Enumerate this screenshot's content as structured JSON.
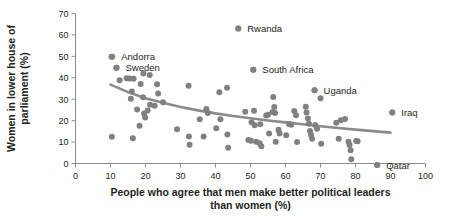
{
  "chart_data": {
    "type": "scatter",
    "title": "",
    "xlabel": "People who agree that men make better political leaders than women (%)",
    "ylabel": "Women in lower house of parliament (%)",
    "xlim": [
      0,
      100
    ],
    "ylim": [
      0,
      70
    ],
    "grid": false,
    "legend": "none",
    "xticks": [
      0,
      10,
      20,
      30,
      40,
      50,
      60,
      70,
      80,
      90,
      100
    ],
    "yticks": [
      0,
      10,
      20,
      30,
      40,
      50,
      60,
      70
    ],
    "point_color": "#808080",
    "trend_color": "#8a8a8a",
    "axis_color": "#8c8c8c",
    "text_color": "#231f20",
    "annotations": [
      {
        "label": "Rwanda",
        "x": 46.5,
        "y": 63.0,
        "dx": 9,
        "dy": 3.5
      },
      {
        "label": "Andorra",
        "x": 10.5,
        "y": 49.8,
        "dx": 9,
        "dy": 3.5
      },
      {
        "label": "Sweden",
        "x": 11.7,
        "y": 44.7,
        "dx": 9,
        "dy": 3.5
      },
      {
        "label": "South Africa",
        "x": 50.8,
        "y": 43.8,
        "dx": 9,
        "dy": 3.5
      },
      {
        "label": "Uganda",
        "x": 68.3,
        "y": 34.2,
        "dx": 9,
        "dy": 3.5
      },
      {
        "label": "Iraq",
        "x": 90.5,
        "y": 23.8,
        "dx": 9,
        "dy": 3.5
      },
      {
        "label": "Qatar",
        "x": 86.2,
        "y": -0.7,
        "dx": 9,
        "dy": 3.5
      }
    ],
    "points": [
      {
        "x": 10.3,
        "y": 49.8
      },
      {
        "x": 11.7,
        "y": 44.7
      },
      {
        "x": 10.4,
        "y": 12.5
      },
      {
        "x": 12.6,
        "y": 38.9
      },
      {
        "x": 14.6,
        "y": 39.8
      },
      {
        "x": 15.5,
        "y": 39.7
      },
      {
        "x": 16.1,
        "y": 33.6
      },
      {
        "x": 15.8,
        "y": 30.2
      },
      {
        "x": 16.6,
        "y": 39.5
      },
      {
        "x": 16.4,
        "y": 11.8
      },
      {
        "x": 17.6,
        "y": 25.2
      },
      {
        "x": 18.3,
        "y": 17.6
      },
      {
        "x": 18.6,
        "y": 37.1
      },
      {
        "x": 19.4,
        "y": 42.0
      },
      {
        "x": 19.3,
        "y": 30.9
      },
      {
        "x": 19.6,
        "y": 23.3
      },
      {
        "x": 19.9,
        "y": 21.5
      },
      {
        "x": 20.6,
        "y": 24.7
      },
      {
        "x": 21.2,
        "y": 41.3
      },
      {
        "x": 21.3,
        "y": 27.4
      },
      {
        "x": 22.6,
        "y": 27.0
      },
      {
        "x": 23.3,
        "y": 37.0
      },
      {
        "x": 23.6,
        "y": 32.7
      },
      {
        "x": 25.0,
        "y": 28.6
      },
      {
        "x": 29.0,
        "y": 16.0
      },
      {
        "x": 32.3,
        "y": 36.3
      },
      {
        "x": 32.4,
        "y": 12.6
      },
      {
        "x": 32.6,
        "y": 8.8
      },
      {
        "x": 35.5,
        "y": 20.6
      },
      {
        "x": 36.6,
        "y": 12.6
      },
      {
        "x": 37.4,
        "y": 25.4
      },
      {
        "x": 37.8,
        "y": 23.6
      },
      {
        "x": 40.2,
        "y": 16.5
      },
      {
        "x": 41.1,
        "y": 33.3
      },
      {
        "x": 41.4,
        "y": 20.7
      },
      {
        "x": 43.3,
        "y": 35.3
      },
      {
        "x": 43.4,
        "y": 13.5
      },
      {
        "x": 43.6,
        "y": 7.3
      },
      {
        "x": 46.5,
        "y": 63.0
      },
      {
        "x": 48.5,
        "y": 24.1
      },
      {
        "x": 49.4,
        "y": 11.0
      },
      {
        "x": 50.1,
        "y": 10.6
      },
      {
        "x": 50.3,
        "y": 19.3
      },
      {
        "x": 50.8,
        "y": 43.8
      },
      {
        "x": 51.0,
        "y": 24.6
      },
      {
        "x": 51.2,
        "y": 17.9
      },
      {
        "x": 51.6,
        "y": 10.2
      },
      {
        "x": 52.6,
        "y": 9.4
      },
      {
        "x": 52.8,
        "y": 18.3
      },
      {
        "x": 53.1,
        "y": 8.1
      },
      {
        "x": 54.5,
        "y": 22.4
      },
      {
        "x": 55.0,
        "y": 22.8
      },
      {
        "x": 55.3,
        "y": 14.0
      },
      {
        "x": 56.3,
        "y": 24.0
      },
      {
        "x": 56.5,
        "y": 31.0
      },
      {
        "x": 56.8,
        "y": 26.4
      },
      {
        "x": 57.0,
        "y": 23.6
      },
      {
        "x": 57.2,
        "y": 10.2
      },
      {
        "x": 58.0,
        "y": 15.8
      },
      {
        "x": 58.3,
        "y": 14.0
      },
      {
        "x": 60.2,
        "y": 13.2
      },
      {
        "x": 61.0,
        "y": 18.4
      },
      {
        "x": 61.6,
        "y": 18.1
      },
      {
        "x": 62.5,
        "y": 24.5
      },
      {
        "x": 63.0,
        "y": 22.5
      },
      {
        "x": 63.3,
        "y": 10.0
      },
      {
        "x": 65.8,
        "y": 26.5
      },
      {
        "x": 66.0,
        "y": 23.8
      },
      {
        "x": 66.4,
        "y": 21.0
      },
      {
        "x": 66.7,
        "y": 18.5
      },
      {
        "x": 67.0,
        "y": 15.2
      },
      {
        "x": 67.3,
        "y": 13.3
      },
      {
        "x": 67.6,
        "y": 11.6
      },
      {
        "x": 68.3,
        "y": 34.2
      },
      {
        "x": 68.5,
        "y": 18.0
      },
      {
        "x": 69.0,
        "y": 16.2
      },
      {
        "x": 70.0,
        "y": 30.4
      },
      {
        "x": 70.2,
        "y": 9.2
      },
      {
        "x": 74.5,
        "y": 19.0
      },
      {
        "x": 75.2,
        "y": 11.5
      },
      {
        "x": 75.8,
        "y": 20.2
      },
      {
        "x": 77.0,
        "y": 20.8
      },
      {
        "x": 78.0,
        "y": 10.2
      },
      {
        "x": 78.3,
        "y": 8.6
      },
      {
        "x": 78.6,
        "y": 6.2
      },
      {
        "x": 78.8,
        "y": 2.0
      },
      {
        "x": 80.2,
        "y": 10.5
      },
      {
        "x": 80.6,
        "y": 10.4
      },
      {
        "x": 86.2,
        "y": -0.7
      },
      {
        "x": 90.5,
        "y": 23.8
      }
    ],
    "trend": [
      {
        "x": 10.0,
        "y": 36.8
      },
      {
        "x": 15.0,
        "y": 33.3
      },
      {
        "x": 20.0,
        "y": 30.5
      },
      {
        "x": 25.0,
        "y": 28.3
      },
      {
        "x": 30.0,
        "y": 26.4
      },
      {
        "x": 35.0,
        "y": 24.8
      },
      {
        "x": 40.0,
        "y": 23.4
      },
      {
        "x": 45.0,
        "y": 22.2
      },
      {
        "x": 50.0,
        "y": 21.1
      },
      {
        "x": 55.0,
        "y": 20.1
      },
      {
        "x": 60.0,
        "y": 19.2
      },
      {
        "x": 65.0,
        "y": 18.3
      },
      {
        "x": 70.0,
        "y": 17.4
      },
      {
        "x": 75.0,
        "y": 16.6
      },
      {
        "x": 80.0,
        "y": 15.8
      },
      {
        "x": 85.0,
        "y": 15.1
      },
      {
        "x": 90.0,
        "y": 14.4
      }
    ]
  },
  "axis": {
    "x_title_line1": "People who agree that men make better political leaders",
    "x_title_line2": "than women (%)",
    "y_title_line1": "Women in lower house of",
    "y_title_line2": "parliament (%)"
  }
}
